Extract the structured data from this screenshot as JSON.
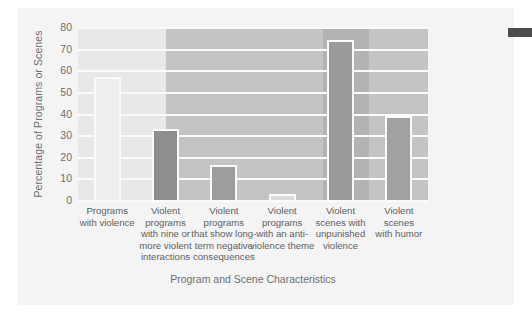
{
  "chart_data": {
    "type": "bar",
    "title": "",
    "xlabel": "Program and Scene Characteristics",
    "ylabel": "Percentage of Programs or Scenes",
    "ylim": [
      0,
      80
    ],
    "yticks": [
      80,
      70,
      60,
      50,
      40,
      30,
      20,
      10,
      0
    ],
    "grid": true,
    "legend": "none",
    "categories": [
      "Programs\nwith violence",
      "Violent\nprograms\nwith nine or\nmore violent\ninteractions",
      "Violent\nprograms\nthat show long-\nterm negative\nconsequences",
      "Violent\nprograms\nwith an anti-\nviolence theme",
      "Violent\nscenes with\nunpunished\nviolence",
      "Violent\nscenes\nwith humor"
    ],
    "category_lines": [
      [
        "Programs",
        "with violence"
      ],
      [
        "Violent",
        "programs",
        "with nine or",
        "more violent",
        "interactions"
      ],
      [
        "Violent",
        "programs",
        "that show long-",
        "term negative",
        "consequences"
      ],
      [
        "Violent",
        "programs",
        "with an anti-",
        "violence theme"
      ],
      [
        "Violent",
        "scenes with",
        "unpunished",
        "violence"
      ],
      [
        "Violent",
        "scenes",
        "with humor"
      ]
    ],
    "values": [
      57,
      33,
      16,
      3,
      74,
      39
    ],
    "bar_colors": [
      "#eeeeee",
      "#8e8e8e",
      "#9d9d9d",
      "#dcdcdc",
      "#9a9a9a",
      "#a1a1a1"
    ],
    "bar_border_color": "#fafafa",
    "plot_background": "#c9c9c9",
    "gridline_color": "#fbfbfb",
    "background_zones": [
      {
        "left_pct": 0,
        "width_pct": 25,
        "color": "#e8e8e8"
      },
      {
        "left_pct": 25,
        "width_pct": 45,
        "color": "#c4c4c4"
      },
      {
        "left_pct": 70,
        "width_pct": 13,
        "color": "#b3b3b3"
      },
      {
        "left_pct": 83,
        "width_pct": 17,
        "color": "#c4c4c4"
      }
    ],
    "text_color": "#6f6f6f",
    "page_background": "#f4f4f4"
  }
}
